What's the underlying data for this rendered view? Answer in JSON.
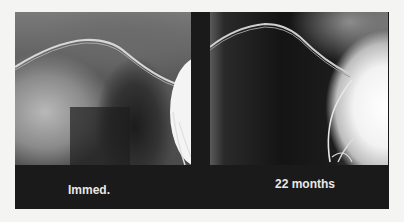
{
  "figure": {
    "panels": [
      {
        "label": "Immed.",
        "description": "chest x-ray immediately post-procedure"
      },
      {
        "label": "22 months",
        "description": "chest x-ray at 22 months follow-up"
      }
    ],
    "colors": {
      "frame": "#1a1a1a",
      "label_text": "#e8e8e8",
      "background": "#f4f4f2"
    }
  }
}
